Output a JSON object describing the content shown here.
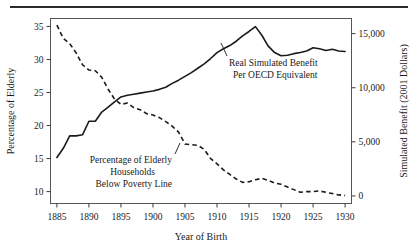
{
  "figure": {
    "top_rule": true,
    "background": "#ffffff",
    "line_color": "#1a1a1a"
  },
  "chart_data": {
    "type": "line",
    "title": "",
    "subtitle": "",
    "xlabel": "Year of Birth",
    "ylabel": "Percentage of Elderly",
    "y2label": "Simulated Benefit (2001 Dollars)",
    "grid": false,
    "legend_position": "inline-annotation",
    "xlim": [
      1884,
      1931
    ],
    "xticks": [
      1885,
      1890,
      1895,
      1900,
      1905,
      1910,
      1915,
      1920,
      1925,
      1930
    ],
    "xticklabels": [
      "1885",
      "1890",
      "1895",
      "1900",
      "1905",
      "1910",
      "1915",
      "1920",
      "1925",
      "1930"
    ],
    "ylim": [
      8.2,
      36.2
    ],
    "yticks": [
      10,
      15,
      20,
      25,
      30,
      35
    ],
    "yticklabels": [
      "10",
      "15",
      "20",
      "25",
      "30",
      "35"
    ],
    "y2lim": [
      -700,
      16400
    ],
    "y2ticks": [
      0,
      5000,
      10000,
      15000
    ],
    "y2ticklabels": [
      "0",
      "5,000",
      "10,000",
      "15,000"
    ],
    "series": [
      {
        "name": "Real Simulated Benefit Per OECD Equivalent",
        "style": "solid",
        "axis": "right",
        "annotation": [
          "Real Simulated Benefit",
          "Per OECD Equivalent"
        ],
        "x": [
          1885,
          1886,
          1887,
          1888,
          1889,
          1890,
          1891,
          1892,
          1893,
          1894,
          1895,
          1896,
          1897,
          1898,
          1899,
          1900,
          1901,
          1902,
          1903,
          1904,
          1905,
          1906,
          1907,
          1908,
          1909,
          1910,
          1911,
          1912,
          1913,
          1914,
          1915,
          1916,
          1917,
          1918,
          1919,
          1920,
          1921,
          1922,
          1923,
          1924,
          1925,
          1926,
          1927,
          1928,
          1929,
          1930
        ],
        "values_right_axis": [
          3550,
          4400,
          5550,
          5550,
          5650,
          6900,
          6900,
          7750,
          8200,
          8700,
          9150,
          9300,
          9400,
          9500,
          9600,
          9700,
          9850,
          10050,
          10400,
          10700,
          11050,
          11400,
          11800,
          12200,
          12700,
          13250,
          13600,
          13900,
          14300,
          14800,
          15200,
          15650,
          14850,
          13850,
          13250,
          12950,
          13000,
          13150,
          13250,
          13400,
          13700,
          13600,
          13450,
          13550,
          13400,
          13350
        ],
        "values_left_axis_equivalent": [
          15.0,
          16.5,
          18.0,
          18.0,
          18.1,
          20.0,
          20.0,
          21.2,
          21.8,
          22.5,
          23.2,
          23.4,
          23.6,
          23.7,
          23.8,
          24.0,
          24.2,
          24.5,
          25.0,
          25.4,
          25.9,
          26.4,
          27.0,
          27.6,
          28.3,
          29.1,
          29.6,
          30.0,
          30.6,
          31.3,
          31.9,
          32.5,
          31.4,
          30.0,
          29.1,
          28.7,
          28.8,
          29.0,
          29.1,
          29.3,
          29.7,
          29.6,
          29.4,
          29.5,
          29.3,
          29.2
        ]
      },
      {
        "name": "Percentage of Elderly Households Below Poverty Line",
        "style": "dashed",
        "axis": "left",
        "annotation": [
          "Percentage of Elderly",
          "Households",
          "Below Poverty Line"
        ],
        "x": [
          1885,
          1886,
          1887,
          1888,
          1889,
          1890,
          1891,
          1892,
          1893,
          1894,
          1895,
          1896,
          1897,
          1898,
          1899,
          1900,
          1901,
          1902,
          1903,
          1904,
          1905,
          1906,
          1907,
          1908,
          1909,
          1910,
          1911,
          1912,
          1913,
          1914,
          1915,
          1916,
          1917,
          1918,
          1919,
          1920,
          1921,
          1922,
          1923,
          1924,
          1925,
          1926,
          1927,
          1928,
          1929,
          1930
        ],
        "values": [
          35.2,
          33.2,
          32.4,
          31.0,
          29.2,
          28.4,
          28.3,
          27.3,
          25.5,
          24.0,
          23.2,
          23.4,
          22.7,
          22.4,
          21.8,
          21.6,
          21.2,
          20.6,
          19.9,
          19.0,
          17.2,
          17.1,
          17.0,
          16.4,
          15.0,
          14.2,
          13.3,
          12.6,
          11.9,
          11.4,
          11.5,
          11.8,
          12.0,
          11.7,
          11.3,
          11.1,
          10.7,
          10.3,
          9.9,
          10.0,
          10.0,
          10.1,
          9.9,
          9.7,
          9.5,
          9.4
        ]
      }
    ]
  },
  "axes": {
    "x_title": "Year of Birth",
    "y_left_title": "Percentage of Elderly",
    "y_right_title": "Simulated Benefit (2001 Dollars)"
  },
  "annotations": {
    "solid_label_line1": "Real Simulated Benefit",
    "solid_label_line2": "Per OECD Equivalent",
    "dashed_label_line1": "Percentage of Elderly",
    "dashed_label_line2": "Households",
    "dashed_label_line3": "Below Poverty Line"
  }
}
